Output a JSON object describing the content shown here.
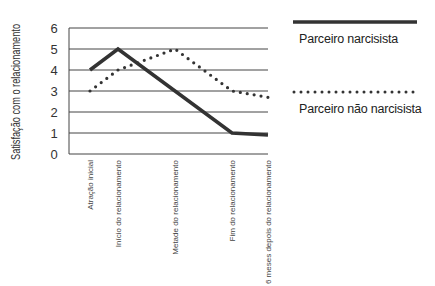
{
  "chart_data": {
    "type": "line",
    "title": "",
    "xlabel": "",
    "ylabel": "Satisfação com o relacionamento",
    "ylim": [
      0,
      6
    ],
    "yticks": [
      0,
      1,
      2,
      3,
      4,
      5,
      6
    ],
    "grid": true,
    "legend_position": "right",
    "categories": [
      "Atração inicial",
      "Início do relacionamento",
      "Metade do relacionamento",
      "Fim do relacionamento",
      "6 meses depois do relacionamento"
    ],
    "series": [
      {
        "name": "Parceiro narcisista",
        "style": "solid",
        "values": [
          4,
          5,
          3,
          1,
          0.9
        ]
      },
      {
        "name": "Parceiro não narcisista",
        "style": "dotted",
        "values": [
          3,
          4,
          5,
          3,
          2.7
        ]
      }
    ]
  },
  "legend": {
    "items": [
      {
        "label": "Parceiro narcisista"
      },
      {
        "label": "Parceiro não narcisista"
      }
    ]
  },
  "colors": {
    "line": "#333333",
    "grid": "#444444"
  }
}
